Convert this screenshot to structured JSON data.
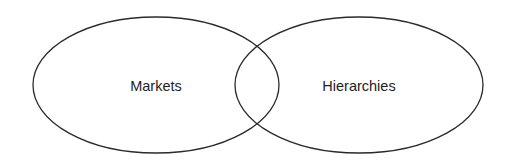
{
  "diagram": {
    "type": "venn",
    "sets": [
      {
        "id": "markets",
        "label": "Markets",
        "cx": 156,
        "cy": 85,
        "rx": 123,
        "ry": 68
      },
      {
        "id": "hierarchies",
        "label": "Hierarchies",
        "cx": 359,
        "cy": 85,
        "rx": 124,
        "ry": 68
      }
    ],
    "stroke_color": "#2a2a2a",
    "background_color": "#ffffff"
  }
}
